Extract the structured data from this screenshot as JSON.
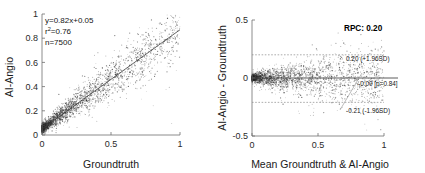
{
  "figure": {
    "background": "#ffffff",
    "point_color": "#2b2b2b",
    "axis_color": "#6e6e6e",
    "line_color": "#3a3a3a"
  },
  "chart_data": [
    {
      "id": "scatter-regression",
      "type": "scatter",
      "title": "",
      "xlabel": "Groundtruth",
      "ylabel": "AI-Angio",
      "xlim": [
        0,
        1
      ],
      "ylim": [
        0,
        1
      ],
      "xticks": [
        0,
        0.5,
        1
      ],
      "xticklabels": [
        "0",
        "0.5",
        "1"
      ],
      "yticks": [
        0,
        0.2,
        0.4,
        0.6,
        0.8,
        1
      ],
      "yticklabels": [
        "0",
        "0.2",
        "0.4",
        "0.6",
        "0.8",
        "1"
      ],
      "grid": false,
      "legend": "none",
      "n": 7500,
      "fit_slope": 0.82,
      "fit_intercept": 0.05,
      "r_squared": 0.76,
      "annotations": {
        "equation": "y=0.82x+0.05",
        "r2_prefix": "r",
        "r2_sup": "2",
        "r2_value": "=0.76",
        "n_label": "n=7500"
      },
      "fit_line": {
        "x": [
          0,
          1
        ],
        "y": [
          0.05,
          0.87
        ]
      },
      "distribution": {
        "shape": "heteroscedastic-fan",
        "x_mode": "right-skewed-near-zero",
        "description": "Dense cluster near origin widening along the regression line toward x=1"
      }
    },
    {
      "id": "bland-altman",
      "type": "scatter",
      "title": "RPC: 0.20",
      "xlabel": "Mean Groundtruth & AI-Angio",
      "ylabel": "AI-Angio - Groundtruth",
      "xlim": [
        0,
        1
      ],
      "ylim": [
        -0.5,
        0.5
      ],
      "xticks": [
        0,
        0.5,
        1
      ],
      "xticklabels": [
        "0",
        "0.5",
        "1"
      ],
      "yticks": [
        -0.5,
        0,
        0.5
      ],
      "yticklabels": [
        "-0.5",
        "0",
        "0.5"
      ],
      "grid": false,
      "legend": "none",
      "rpc": 0.2,
      "bias": -0.0,
      "p_value": 0.84,
      "upper_loa": 0.2,
      "lower_loa": -0.21,
      "reference_lines": [
        {
          "name": "upper-loa",
          "y": 0.2,
          "style": "dotted",
          "label": "0.20 (+1.96SD)"
        },
        {
          "name": "bias",
          "y": 0.0,
          "style": "solid",
          "label": "-0.00 [p=0.84]"
        },
        {
          "name": "lower-loa",
          "y": -0.21,
          "style": "dotted",
          "label": "-0.21 (-1.96SD)"
        }
      ],
      "annotations": {
        "rpc_label": "RPC: 0.20",
        "upper_label": "0.20 (+1.96SD)",
        "bias_label": "-0.00 [p=0.84]",
        "lower_label": "-0.21 (-1.96SD)"
      },
      "distribution": {
        "shape": "horizontal-funnel",
        "description": "Tight at low means, fanning out symmetrically about zero as mean increases"
      }
    }
  ]
}
